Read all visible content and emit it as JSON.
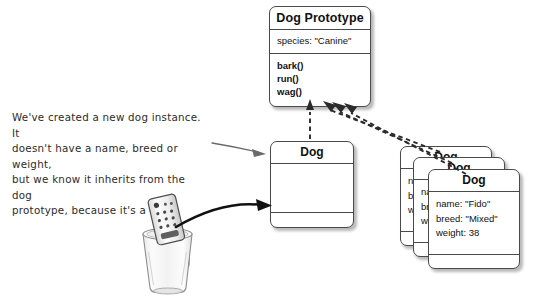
{
  "diagram": {
    "background_color": "#ffffff",
    "line_color": "#4a4a4a",
    "text_color": "#111111"
  },
  "prototype_box": {
    "title": "Dog Prototype",
    "properties": [
      "species: \"Canine\""
    ],
    "methods": [
      "bark()",
      "run()",
      "wag()"
    ]
  },
  "new_instance_box": {
    "title": "Dog",
    "properties": [],
    "methods": []
  },
  "instance_stack": [
    {
      "title": "Dog",
      "visible_fragments": [
        "na",
        "br",
        "we"
      ],
      "properties": [
        "name",
        "breed",
        "weight"
      ]
    },
    {
      "title": "Dog",
      "visible_fragments": [
        "na",
        "br",
        "we"
      ],
      "properties": [
        "name",
        "breed",
        "weight"
      ]
    },
    {
      "title": "Dog",
      "properties": [
        "name: \"Fido\"",
        "breed: \"Mixed\"",
        "weight: 38"
      ]
    }
  ],
  "annotation": {
    "line1": "We've created a new dog instance. It",
    "line2": "doesn't have a name, breed or weight,",
    "line3": "but we know it inherits from the dog",
    "line4": "prototype, because it's a dog."
  },
  "cup": {
    "label": "aDog",
    "contains": "remote-control-object"
  },
  "arrows": {
    "annotation_pointer": "thin hand-drawn arrow pointing right to the Dog instance box",
    "cup_pointer": "thick curved arrow from the aDog cup to the Dog instance box",
    "prototype_links": "four dashed arrows pointing up to the Dog Prototype box"
  }
}
